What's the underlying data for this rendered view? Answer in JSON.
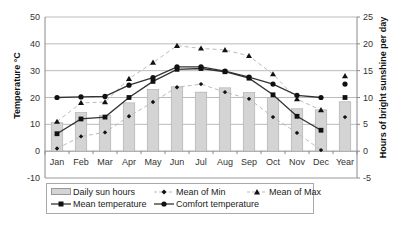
{
  "chart_data": {
    "type": "bar+line",
    "categories": [
      "Jan",
      "Feb",
      "Mar",
      "Apr",
      "May",
      "Jun",
      "Jul",
      "Aug",
      "Sep",
      "Oct",
      "Nov",
      "Dec",
      "Year"
    ],
    "left_axis": {
      "label": "Temperature °C",
      "ylim": [
        -10,
        50
      ],
      "ticks": [
        -10,
        0,
        10,
        20,
        30,
        40,
        50
      ]
    },
    "right_axis": {
      "label": "Hours of bright sunshine per day",
      "ylim": [
        -5,
        25
      ],
      "ticks": [
        -5,
        0,
        5,
        10,
        15,
        20,
        25
      ]
    },
    "grid": true,
    "legend_position": "bottom",
    "series": [
      {
        "name": "Daily sun hours",
        "type": "bar",
        "axis": "right",
        "color": "#d4d4d4",
        "values": [
          5.3,
          7.2,
          6.7,
          9.0,
          11.5,
          12.0,
          11.0,
          11.8,
          10.9,
          10.0,
          7.9,
          7.7,
          9.2
        ]
      },
      {
        "name": "Mean of Min",
        "type": "line",
        "axis": "left",
        "marker": "diamond",
        "dash": true,
        "color": "#bbbbbb",
        "values": [
          1.0,
          5.5,
          7.0,
          13.0,
          18.3,
          23.8,
          25.0,
          22.0,
          19.5,
          12.7,
          6.8,
          0.4,
          12.7
        ]
      },
      {
        "name": "Mean of Max",
        "type": "line",
        "axis": "left",
        "marker": "triangle",
        "dash": true,
        "color": "#bbbbbb",
        "values": [
          11.0,
          18.0,
          18.3,
          27.0,
          33.0,
          39.3,
          38.3,
          37.7,
          35.5,
          28.7,
          19.4,
          15.3,
          28.0
        ]
      },
      {
        "name": "Mean temperature",
        "type": "line",
        "axis": "left",
        "marker": "square",
        "color": "#333333",
        "values": [
          6.5,
          12.0,
          12.7,
          20.0,
          26.0,
          30.5,
          30.8,
          29.6,
          27.2,
          21.0,
          13.0,
          7.8,
          20.0
        ]
      },
      {
        "name": "Comfort temperature",
        "type": "line",
        "axis": "left",
        "marker": "circle",
        "color": "#333333",
        "values": [
          20.0,
          20.2,
          20.4,
          24.6,
          27.4,
          31.4,
          31.4,
          29.8,
          27.6,
          25.0,
          20.8,
          20.0,
          25.0
        ]
      }
    ]
  },
  "legend": {
    "sun": "Daily sun hours",
    "min": "Mean of Min",
    "max": "Mean of Max",
    "mean": "Mean temperature",
    "comfort": "Comfort temperature"
  }
}
